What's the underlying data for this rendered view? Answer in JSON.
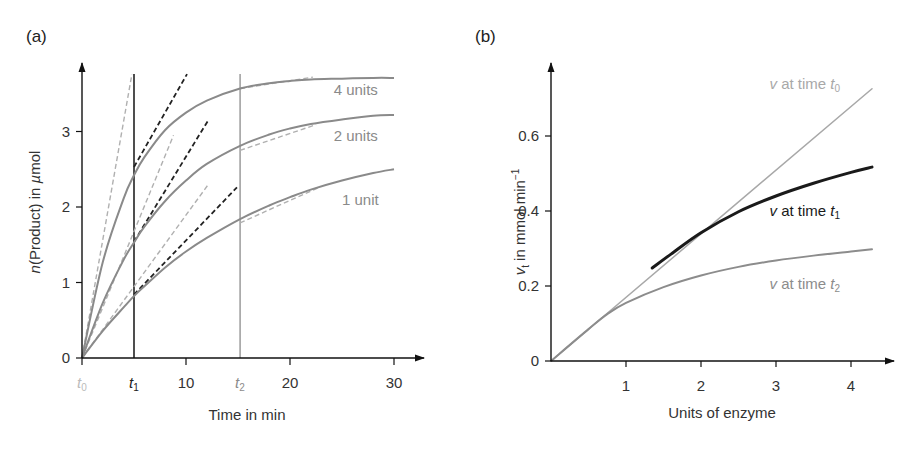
{
  "chart_data": [
    {
      "panel": "(a)",
      "type": "line",
      "title": "",
      "xlabel": "Time in min",
      "ylabel": "n(Product) in µmol",
      "xlim": [
        0,
        33
      ],
      "ylim": [
        0,
        3.8
      ],
      "grid": false,
      "x_ticks": [
        0,
        10,
        20,
        30
      ],
      "x_tick_labels": [
        "",
        "10",
        "20",
        "30"
      ],
      "y_ticks": [
        0,
        1,
        2,
        3
      ],
      "y_tick_labels": [
        "0",
        "1",
        "2",
        "3"
      ],
      "time_markers": [
        {
          "label": "t",
          "sub": "0",
          "x": 0,
          "color": "#bbbbbb",
          "line": false
        },
        {
          "label": "t",
          "sub": "1",
          "x": 5,
          "color": "#222222",
          "line": true
        },
        {
          "label": "t",
          "sub": "2",
          "x": 15.2,
          "color": "#8c8c8c",
          "line": true
        }
      ],
      "x": [
        0,
        2,
        4,
        5,
        6,
        8,
        10,
        12,
        15.2,
        18,
        20,
        22,
        25,
        28,
        30
      ],
      "series": [
        {
          "name": "4 units",
          "values": [
            0,
            1.27,
            2.11,
            2.42,
            2.66,
            3.02,
            3.25,
            3.41,
            3.57,
            3.64,
            3.67,
            3.69,
            3.7,
            3.71,
            3.71
          ]
        },
        {
          "name": "2 units",
          "values": [
            0,
            0.73,
            1.3,
            1.53,
            1.74,
            2.08,
            2.35,
            2.57,
            2.81,
            2.96,
            3.04,
            3.1,
            3.16,
            3.21,
            3.22
          ]
        },
        {
          "name": "1 unit",
          "values": [
            0,
            0.36,
            0.67,
            0.82,
            0.95,
            1.2,
            1.41,
            1.59,
            1.84,
            2.02,
            2.13,
            2.23,
            2.35,
            2.45,
            2.5
          ]
        }
      ],
      "tangents_t0": [
        {
          "series": "4 units",
          "from": [
            0,
            0
          ],
          "to": [
            4.8,
            3.76
          ],
          "style": "gray-dashed"
        },
        {
          "series": "2 units",
          "from": [
            0,
            0
          ],
          "to": [
            8.8,
            2.95
          ],
          "style": "gray-dashed"
        },
        {
          "series": "1 unit",
          "from": [
            0,
            0
          ],
          "to": [
            12.1,
            2.29
          ],
          "style": "gray-dashed"
        }
      ],
      "tangents_t1": [
        {
          "series": "4 units",
          "from": [
            5,
            2.53
          ],
          "to": [
            10.1,
            3.76
          ],
          "style": "black-dashed"
        },
        {
          "series": "2 units",
          "from": [
            5,
            1.54
          ],
          "to": [
            12.1,
            3.14
          ],
          "style": "black-dashed"
        },
        {
          "series": "1 unit",
          "from": [
            5,
            0.84
          ],
          "to": [
            14.9,
            2.26
          ],
          "style": "black-dashed"
        }
      ],
      "tangents_t2": [
        {
          "series": "4 units",
          "from": [
            15.2,
            3.57
          ],
          "to": [
            22.2,
            3.72
          ],
          "style": "gray-dashed"
        },
        {
          "series": "2 units",
          "from": [
            15.2,
            2.75
          ],
          "to": [
            22.5,
            3.09
          ],
          "style": "gray-dashed"
        },
        {
          "series": "1 unit",
          "from": [
            15.2,
            1.79
          ],
          "to": [
            22.8,
            2.26
          ],
          "style": "gray-dashed"
        }
      ],
      "annotations": [
        {
          "text": "4 units",
          "x": 24.2,
          "y": 3.49
        },
        {
          "text": "2 units",
          "x": 24.2,
          "y": 2.87
        },
        {
          "text": "1 unit",
          "x": 25.0,
          "y": 2.03
        }
      ]
    },
    {
      "panel": "(b)",
      "type": "line",
      "title": "",
      "xlabel": "Units of enzyme",
      "ylabel": "vt in mmol min⁻¹",
      "xlim": [
        0,
        4.5
      ],
      "ylim": [
        0,
        0.75
      ],
      "grid": false,
      "x_ticks": [
        1,
        2,
        3,
        4
      ],
      "x_tick_labels": [
        "1",
        "2",
        "3",
        "4"
      ],
      "y_ticks": [
        0,
        0.2,
        0.4,
        0.6
      ],
      "y_tick_labels": [
        "0",
        "0.2",
        "0.4",
        "0.6"
      ],
      "series": [
        {
          "name": "v at time t0",
          "color": "#a8a8a8",
          "x": [
            0,
            4.28
          ],
          "values": [
            0,
            0.726
          ]
        },
        {
          "name": "v at time t1",
          "color": "#1a1a1a",
          "x": [
            1.35,
            1.6,
            2.0,
            2.5,
            3.0,
            3.5,
            4.0,
            4.28
          ],
          "values": [
            0.248,
            0.285,
            0.342,
            0.398,
            0.44,
            0.474,
            0.503,
            0.517
          ]
        },
        {
          "name": "v at time t2",
          "color": "#8c8c8c",
          "x": [
            0,
            0.5,
            0.75,
            1.0,
            1.5,
            2.0,
            2.5,
            3.0,
            3.5,
            4.0,
            4.28
          ],
          "values": [
            0,
            0.085,
            0.125,
            0.155,
            0.197,
            0.228,
            0.251,
            0.268,
            0.281,
            0.292,
            0.298
          ]
        }
      ],
      "annotations": [
        {
          "text": "v at time t0",
          "x": 2.98,
          "y": 0.74,
          "color": "#a8a8a8"
        },
        {
          "text": "v at time t1",
          "x": 2.98,
          "y": 0.4,
          "color": "#1a1a1a"
        },
        {
          "text": "v at time t2",
          "x": 2.98,
          "y": 0.205,
          "color": "#8c8c8c"
        }
      ]
    }
  ],
  "panel_a": {
    "label": "(a)",
    "xlabel": "Time in min",
    "ylabel_n": "n",
    "ylabel_rest": "(Product) in ",
    "ylabel_mu": "µ",
    "ylabel_unit": "mol",
    "series_labels": [
      "4 units",
      "2 units",
      "1 unit"
    ]
  },
  "panel_b": {
    "label": "(b)",
    "xlabel": "Units of enzyme",
    "ylabel_v": "v",
    "ylabel_sub": "t",
    "ylabel_rest": " in mmol min",
    "ylabel_sup": "−1",
    "series_labels": [
      {
        "v": "v",
        "mid": " at time ",
        "t": "t",
        "sub": "0"
      },
      {
        "v": "v",
        "mid": " at time ",
        "t": "t",
        "sub": "1"
      },
      {
        "v": "v",
        "mid": " at time ",
        "t": "t",
        "sub": "2"
      }
    ]
  }
}
